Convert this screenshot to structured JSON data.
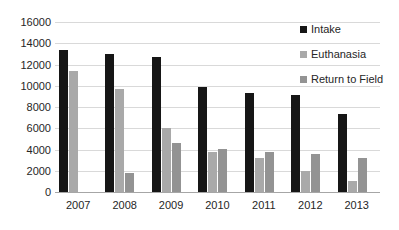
{
  "chart_data": {
    "type": "bar",
    "title": "",
    "xlabel": "",
    "ylabel": "",
    "ylim": [
      0,
      16000
    ],
    "yticks": [
      0,
      2000,
      4000,
      6000,
      8000,
      10000,
      12000,
      14000,
      16000
    ],
    "ytick_labels": [
      "0",
      "2000",
      "4000",
      "6000",
      "8000",
      "10000",
      "12000",
      "14000",
      "16000"
    ],
    "grid": true,
    "legend_position": "top-right",
    "categories": [
      "2007",
      "2008",
      "2009",
      "2010",
      "2011",
      "2012",
      "2013"
    ],
    "series": [
      {
        "name": "Intake",
        "color": "#161616",
        "values": [
          13400,
          13000,
          12700,
          9900,
          9300,
          9100,
          7300
        ]
      },
      {
        "name": "Euthanasia",
        "color": "#a9a9a9",
        "values": [
          11400,
          9700,
          6000,
          3800,
          3200,
          2000,
          1000
        ]
      },
      {
        "name": "Return to Field",
        "color": "#939393",
        "values": [
          null,
          1800,
          4600,
          4050,
          3800,
          3600,
          3200
        ]
      }
    ]
  }
}
